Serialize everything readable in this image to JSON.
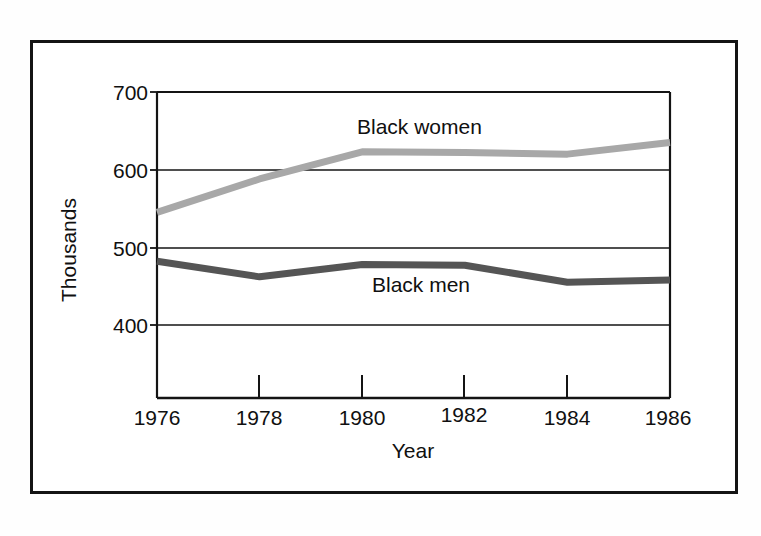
{
  "figure": {
    "frame_color": "#141414",
    "background": "#ffffff"
  },
  "chart_data": {
    "type": "line",
    "title": "",
    "xlabel": "Year",
    "ylabel": "Thousands",
    "x": [
      1976,
      1978,
      1980,
      1982,
      1984,
      1986
    ],
    "xticklabels": [
      "1976",
      "1978",
      "1980",
      "1982",
      "1984",
      "1986"
    ],
    "yticks": [
      400,
      500,
      600,
      700
    ],
    "yticklabels": [
      "400",
      "500",
      "600",
      "700"
    ],
    "xlim": [
      1976,
      1986
    ],
    "ylim": [
      360,
      700
    ],
    "grid": true,
    "grid_axis": "y",
    "legend_position": "inline-labels",
    "series": [
      {
        "name": "Black women",
        "color": "#a8a8a8",
        "label_text": "Black women",
        "values": [
          545,
          588,
          623,
          622,
          620,
          635
        ]
      },
      {
        "name": "Black men",
        "color": "#555555",
        "label_text": "Black men",
        "values": [
          482,
          462,
          478,
          477,
          455,
          458
        ]
      }
    ]
  }
}
